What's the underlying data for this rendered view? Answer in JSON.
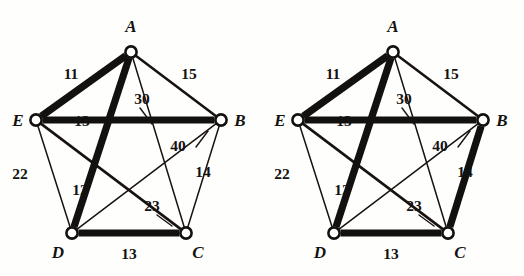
{
  "figure": {
    "background_color": "#fefefd",
    "ink_color": "#141210",
    "panels": [
      {
        "id": "left-graph",
        "name": "weighted-graph-left",
        "origin_x": 0,
        "nodes": [
          {
            "id": "A",
            "label": "A",
            "x": 131,
            "y": 52,
            "label_x": 131,
            "label_y": 32
          },
          {
            "id": "B",
            "label": "B",
            "x": 221,
            "y": 120,
            "label_x": 240,
            "label_y": 126
          },
          {
            "id": "C",
            "label": "C",
            "x": 186,
            "y": 233,
            "label_x": 198,
            "label_y": 258
          },
          {
            "id": "D",
            "label": "D",
            "x": 72,
            "y": 233,
            "label_x": 58,
            "label_y": 258
          },
          {
            "id": "E",
            "label": "E",
            "x": 36,
            "y": 120,
            "label_x": 18,
            "label_y": 126
          }
        ],
        "edges": [
          {
            "from": "A",
            "to": "E",
            "weight": "11",
            "style": "bold",
            "label_x": 71,
            "label_y": 79
          },
          {
            "from": "A",
            "to": "B",
            "weight": "15",
            "style": "medium",
            "label_x": 189,
            "label_y": 79
          },
          {
            "from": "A",
            "to": "C",
            "weight": "30",
            "style": "thin",
            "label_x": 142,
            "label_y": 104
          },
          {
            "from": "A",
            "to": "D",
            "weight": "12",
            "style": "bold",
            "label_x": 80,
            "label_y": 195
          },
          {
            "from": "E",
            "to": "B",
            "weight": "13",
            "style": "bold",
            "label_x": 82,
            "label_y": 126
          },
          {
            "from": "E",
            "to": "D",
            "weight": "22",
            "style": "thin",
            "label_x": 20,
            "label_y": 179
          },
          {
            "from": "E",
            "to": "C",
            "weight": "23",
            "style": "medium",
            "label_x": 152,
            "label_y": 211
          },
          {
            "from": "B",
            "to": "C",
            "weight": "14",
            "style": "thin",
            "label_x": 203,
            "label_y": 177
          },
          {
            "from": "B",
            "to": "D",
            "weight": "40",
            "style": "thin",
            "label_x": 178,
            "label_y": 151
          },
          {
            "from": "D",
            "to": "C",
            "weight": "13",
            "style": "bold",
            "label_x": 129,
            "label_y": 259
          }
        ],
        "leaders": [
          {
            "name": "leader-30",
            "x1": 140,
            "y1": 108,
            "x2": 152,
            "y2": 124
          },
          {
            "name": "leader-40",
            "x1": 196,
            "y1": 147,
            "x2": 208,
            "y2": 131
          },
          {
            "name": "leader-23",
            "x1": 157,
            "y1": 215,
            "x2": 172,
            "y2": 226
          }
        ]
      },
      {
        "id": "right-graph",
        "name": "weighted-graph-right",
        "origin_x": 262,
        "nodes": [
          {
            "id": "A",
            "label": "A",
            "x": 131,
            "y": 52,
            "label_x": 131,
            "label_y": 32
          },
          {
            "id": "B",
            "label": "B",
            "x": 221,
            "y": 120,
            "label_x": 240,
            "label_y": 126
          },
          {
            "id": "C",
            "label": "C",
            "x": 186,
            "y": 233,
            "label_x": 198,
            "label_y": 258
          },
          {
            "id": "D",
            "label": "D",
            "x": 72,
            "y": 233,
            "label_x": 58,
            "label_y": 258
          },
          {
            "id": "E",
            "label": "E",
            "x": 36,
            "y": 120,
            "label_x": 18,
            "label_y": 126
          }
        ],
        "edges": [
          {
            "from": "A",
            "to": "E",
            "weight": "11",
            "style": "bold",
            "label_x": 71,
            "label_y": 79
          },
          {
            "from": "A",
            "to": "B",
            "weight": "15",
            "style": "medium",
            "label_x": 189,
            "label_y": 79
          },
          {
            "from": "A",
            "to": "C",
            "weight": "30",
            "style": "thin",
            "label_x": 142,
            "label_y": 104
          },
          {
            "from": "A",
            "to": "D",
            "weight": "12",
            "style": "bold",
            "label_x": 80,
            "label_y": 195
          },
          {
            "from": "E",
            "to": "B",
            "weight": "13",
            "style": "bold",
            "label_x": 82,
            "label_y": 126
          },
          {
            "from": "E",
            "to": "D",
            "weight": "22",
            "style": "thin",
            "label_x": 20,
            "label_y": 179
          },
          {
            "from": "E",
            "to": "C",
            "weight": "23",
            "style": "medium",
            "label_x": 152,
            "label_y": 211
          },
          {
            "from": "B",
            "to": "C",
            "weight": "14",
            "style": "bold",
            "label_x": 203,
            "label_y": 177
          },
          {
            "from": "B",
            "to": "D",
            "weight": "40",
            "style": "thin",
            "label_x": 178,
            "label_y": 151
          },
          {
            "from": "D",
            "to": "C",
            "weight": "13",
            "style": "bold",
            "label_x": 129,
            "label_y": 259
          }
        ],
        "leaders": [
          {
            "name": "leader-30",
            "x1": 140,
            "y1": 108,
            "x2": 152,
            "y2": 124
          },
          {
            "name": "leader-40",
            "x1": 196,
            "y1": 147,
            "x2": 208,
            "y2": 131
          },
          {
            "name": "leader-23",
            "x1": 157,
            "y1": 215,
            "x2": 172,
            "y2": 226
          }
        ]
      }
    ]
  }
}
